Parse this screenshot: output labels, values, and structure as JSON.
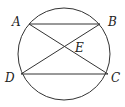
{
  "diagram": {
    "type": "circle-chords",
    "circle": {
      "cx": 64,
      "cy": 54,
      "r": 46
    },
    "points": [
      {
        "name": "A",
        "x": 29,
        "y": 24,
        "label_x": 12,
        "label_y": 26
      },
      {
        "name": "B",
        "x": 100,
        "y": 24,
        "label_x": 108,
        "label_y": 26
      },
      {
        "name": "C",
        "x": 108,
        "y": 74,
        "label_x": 111,
        "label_y": 82
      },
      {
        "name": "D",
        "x": 21,
        "y": 74,
        "label_x": 5,
        "label_y": 82
      },
      {
        "name": "E",
        "x": 64,
        "y": 49,
        "label_x": 75,
        "label_y": 52
      }
    ],
    "segments": [
      {
        "from": "A",
        "to": "B"
      },
      {
        "from": "D",
        "to": "C"
      },
      {
        "from": "A",
        "to": "C"
      },
      {
        "from": "B",
        "to": "D"
      }
    ],
    "labels": {
      "A": "A",
      "B": "B",
      "C": "C",
      "D": "D",
      "E": "E"
    },
    "stroke_color": "#333333"
  }
}
